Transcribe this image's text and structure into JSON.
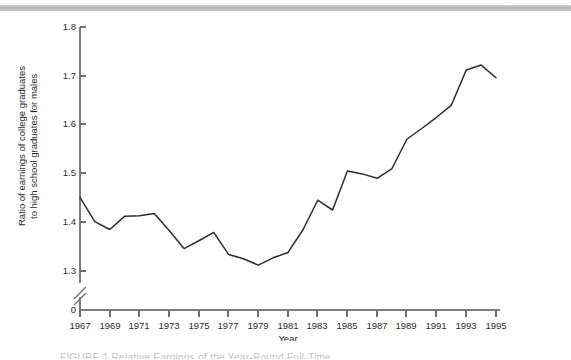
{
  "figure": {
    "ylabel_line1": "Ratio of earnings of college graduates",
    "ylabel_line2": "to high school graduates for males",
    "xlabel": "Year",
    "zero_label": "0",
    "caption_partial": "FIGURE 1  Relative Earnings of the Year-Round Full-Time..."
  },
  "chart_data": {
    "type": "line",
    "title": "",
    "xlabel": "Year",
    "ylabel": "Ratio of earnings of college graduates to high school graduates for males",
    "xlim": [
      1967,
      1995
    ],
    "ylim": [
      1.3,
      1.8
    ],
    "y_axis_break": true,
    "y_break_to": 0,
    "grid": false,
    "legend": null,
    "ytick_labels": [
      "1.8",
      "1.7",
      "1.6",
      "1.5",
      "1.4",
      "1.3",
      "0"
    ],
    "yticks": [
      1.8,
      1.7,
      1.6,
      1.5,
      1.4,
      1.3
    ],
    "xtick_labels": [
      "1967",
      "1969",
      "1971",
      "1973",
      "1975",
      "1977",
      "1979",
      "1981",
      "1983",
      "1985",
      "1987",
      "1989",
      "1991",
      "1993",
      "1995"
    ],
    "xticks": [
      1967,
      1969,
      1971,
      1973,
      1975,
      1977,
      1979,
      1981,
      1983,
      1985,
      1987,
      1989,
      1991,
      1993,
      1995
    ],
    "x": [
      1967,
      1968,
      1969,
      1970,
      1971,
      1972,
      1973,
      1974,
      1975,
      1976,
      1977,
      1978,
      1979,
      1980,
      1981,
      1982,
      1983,
      1984,
      1985,
      1986,
      1987,
      1988,
      1989,
      1990,
      1991,
      1992,
      1993,
      1994,
      1995
    ],
    "values": [
      1.451,
      1.401,
      1.385,
      1.412,
      1.413,
      1.418,
      1.383,
      1.346,
      1.362,
      1.379,
      1.334,
      1.325,
      1.312,
      1.327,
      1.338,
      1.384,
      1.445,
      1.425,
      1.505,
      1.499,
      1.49,
      1.51,
      1.57,
      1.592,
      1.615,
      1.64,
      1.712,
      1.722,
      1.696
    ],
    "series": [
      {
        "name": "College / high school earnings ratio (males)",
        "color": "#2b2b2b",
        "values": [
          1.451,
          1.401,
          1.385,
          1.412,
          1.413,
          1.418,
          1.383,
          1.346,
          1.362,
          1.379,
          1.334,
          1.325,
          1.312,
          1.327,
          1.338,
          1.384,
          1.445,
          1.425,
          1.505,
          1.499,
          1.49,
          1.51,
          1.57,
          1.592,
          1.615,
          1.64,
          1.712,
          1.722,
          1.696
        ]
      }
    ]
  },
  "colors": {
    "line": "#2b2b2b",
    "axis": "#7d7d7d",
    "band": "#b4b4b4",
    "text": "#2a2a2a"
  }
}
